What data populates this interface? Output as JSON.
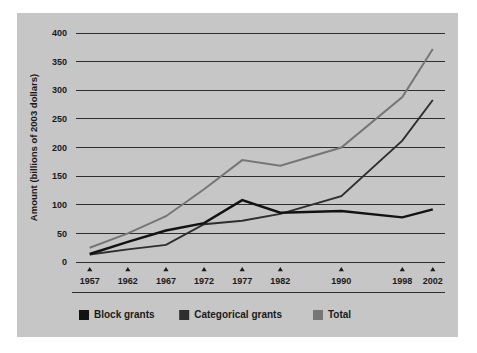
{
  "figure": {
    "background_color": "#c6c6c6",
    "page_color": "#ffffff",
    "axis_color": "#1e1e1e"
  },
  "chart_data": {
    "type": "line",
    "title": "",
    "xlabel": "",
    "ylabel": "Amount (billions of 2003 dollars)",
    "x": [
      1957,
      1962,
      1967,
      1972,
      1977,
      1982,
      1990,
      1998,
      2002
    ],
    "categories": [
      "1957",
      "1962",
      "1967",
      "1972",
      "1977",
      "1982",
      "1990",
      "1998",
      "2002"
    ],
    "xlim": [
      1955.2,
      2003.6
    ],
    "ylim": [
      0,
      400
    ],
    "yticks": [
      0,
      50,
      100,
      150,
      200,
      250,
      300,
      350,
      400
    ],
    "ytick_labels": [
      "0",
      "50",
      "100",
      "150",
      "200",
      "250",
      "300",
      "350",
      "400"
    ],
    "grid": true,
    "grid_axis": "y",
    "legend_position": "bottom-left",
    "series": [
      {
        "name": "Block grants",
        "color": "#121212",
        "width": 2.4,
        "values": [
          14,
          35,
          55,
          68,
          108,
          86,
          89,
          78,
          92
        ]
      },
      {
        "name": "Categorical grants",
        "color": "#2e2e2e",
        "width": 1.9,
        "values": [
          13,
          22,
          30,
          66,
          72,
          84,
          115,
          212,
          283
        ]
      },
      {
        "name": "Total",
        "color": "#767676",
        "width": 2.0,
        "values": [
          25,
          50,
          80,
          127,
          178,
          168,
          200,
          288,
          372
        ]
      }
    ]
  },
  "legend": {
    "items": [
      {
        "label": "Block grants",
        "color": "#121212"
      },
      {
        "label": "Categorical grants",
        "color": "#2e2e2e"
      },
      {
        "label": "Total",
        "color": "#767676"
      }
    ]
  }
}
